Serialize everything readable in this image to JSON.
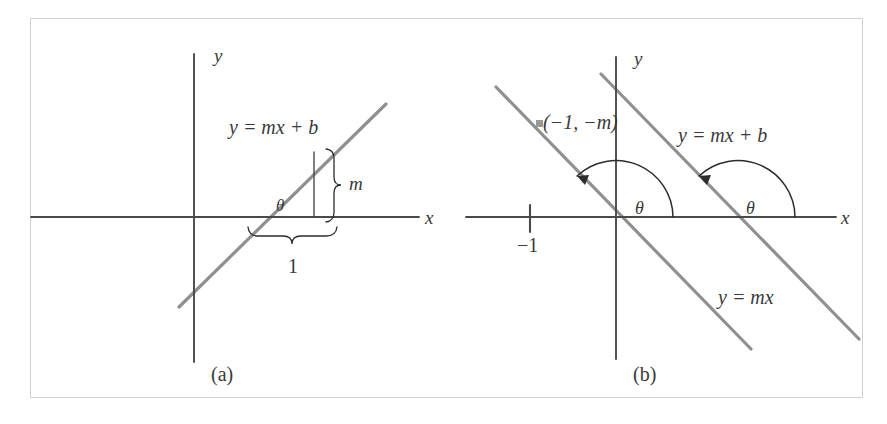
{
  "figure": {
    "kind": "math-diagram",
    "background_color": "#ffffff",
    "frame_color": "#d2d2d2",
    "axis_color": "#4a4a4a",
    "line_color": "#909090",
    "text_color": "#3a3a3a",
    "arc_color": "#2d2d2d",
    "point_marker_color": "#9a9a9a"
  },
  "panel_a": {
    "caption": "(a)",
    "y_axis_label": "y",
    "x_axis_label": "x",
    "line_label": "y = mx + b",
    "angle_label": "θ",
    "rise_brace_label": "m",
    "run_brace_label": "1",
    "description": "Line of positive slope m crossing the x-axis at angle theta, with a run of 1 and rise of m marked by braces."
  },
  "panel_b": {
    "caption": "(b)",
    "y_axis_label": "y",
    "x_axis_label": "x",
    "line_label_upper": "y = mx + b",
    "line_label_lower": "y = mx",
    "angle_label_left": "θ",
    "angle_label_right": "θ",
    "point_label": "(−1, −m)",
    "tick_label": "−1",
    "description": "Two parallel lines of negative slope; each makes the same obtuse angle theta with the positive x-axis. The point (-1, -m) lies on the line y = mx, and -1 is marked on the x-axis."
  }
}
